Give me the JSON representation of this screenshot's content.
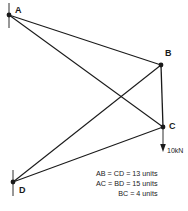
{
  "diagram": {
    "type": "truss-structural-diagram",
    "stroke_color": "#1a1a1a",
    "background_color": "#ffffff",
    "nodes": [
      {
        "id": "A",
        "label": "A",
        "x": 9,
        "y": 15,
        "support": "pin",
        "label_dx": 6,
        "label_dy": -9
      },
      {
        "id": "B",
        "label": "B",
        "x": 161,
        "y": 65,
        "support": "none",
        "label_dx": 4,
        "label_dy": -16
      },
      {
        "id": "C",
        "label": "C",
        "x": 163,
        "y": 127,
        "support": "none",
        "label_dx": 6,
        "label_dy": -5
      },
      {
        "id": "D",
        "label": "D",
        "x": 13,
        "y": 182,
        "support": "pin",
        "label_dx": 6,
        "label_dy": 4
      }
    ],
    "members": [
      {
        "id": "AB",
        "from": "A",
        "to": "B"
      },
      {
        "id": "AC",
        "from": "A",
        "to": "C"
      },
      {
        "id": "BC",
        "from": "B",
        "to": "C"
      },
      {
        "id": "BD",
        "from": "B",
        "to": "D"
      },
      {
        "id": "CD",
        "from": "C",
        "to": "D"
      }
    ],
    "load": {
      "at_node": "C",
      "label": "10kN",
      "magnitude": 10,
      "unit": "kN",
      "direction": "down",
      "arrow_length": 24
    },
    "supports": [
      {
        "at_node": "A",
        "kind": "vertical-tick"
      },
      {
        "at_node": "D",
        "kind": "vertical-tick"
      }
    ]
  },
  "legend": {
    "lines": [
      "AB  =  CD  =  13 units",
      "AC  =  BD  =  15 units",
      "BC  =   4 units"
    ]
  }
}
